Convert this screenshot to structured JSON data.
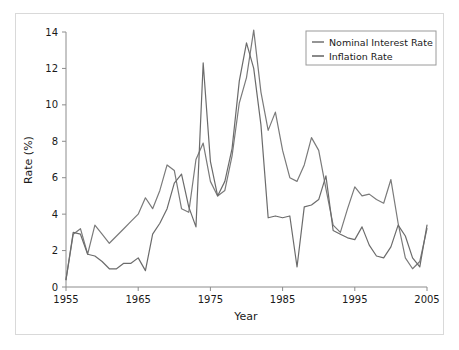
{
  "figure": {
    "background_color": "#ffffff",
    "frame_color": "#d9d9d9",
    "axis_color": "#8c8c8c"
  },
  "axes": {
    "y_title": "Rate (%)",
    "x_title": "Year",
    "y_ticks": [
      "0",
      "2",
      "4",
      "6",
      "8",
      "10",
      "12",
      "14"
    ],
    "x_ticks": [
      "1955",
      "1965",
      "1975",
      "1985",
      "1995",
      "2005"
    ]
  },
  "legend": {
    "position": "top-right",
    "entries": [
      {
        "label": "Nominal Interest Rate",
        "color": "#7a7a7a"
      },
      {
        "label": "Inflation Rate",
        "color": "#6b6b6b"
      }
    ]
  },
  "chart_data": {
    "type": "line",
    "title": "",
    "subtitle": "",
    "xlabel": "Year",
    "ylabel": "Rate (%)",
    "xlim": [
      1955,
      2005
    ],
    "ylim": [
      0,
      14
    ],
    "y_ticks": [
      0,
      2,
      4,
      6,
      8,
      10,
      12,
      14
    ],
    "x_ticks": [
      1955,
      1965,
      1975,
      1985,
      1995,
      2005
    ],
    "grid": false,
    "legend_position": "top-right",
    "x": [
      1955,
      1956,
      1957,
      1958,
      1959,
      1960,
      1961,
      1962,
      1963,
      1964,
      1965,
      1966,
      1967,
      1968,
      1969,
      1970,
      1971,
      1972,
      1973,
      1974,
      1975,
      1976,
      1977,
      1978,
      1979,
      1980,
      1981,
      1982,
      1983,
      1984,
      1985,
      1986,
      1987,
      1988,
      1989,
      1990,
      1991,
      1992,
      1993,
      1994,
      1995,
      1996,
      1997,
      1998,
      1999,
      2000,
      2001,
      2002,
      2003,
      2004,
      2005
    ],
    "series": [
      {
        "name": "Nominal Interest Rate",
        "color": "#7a7a7a",
        "values": [
          0.4,
          2.9,
          3.2,
          1.8,
          3.4,
          2.9,
          2.4,
          2.8,
          3.2,
          3.6,
          4.0,
          4.9,
          4.3,
          5.3,
          6.7,
          6.4,
          4.3,
          4.1,
          7.0,
          7.9,
          5.8,
          5.0,
          5.3,
          7.2,
          10.1,
          11.5,
          14.1,
          10.7,
          8.6,
          9.6,
          7.5,
          6.0,
          5.8,
          6.7,
          8.2,
          7.5,
          5.4,
          3.4,
          3.0,
          4.3,
          5.5,
          5.0,
          5.1,
          4.8,
          4.6,
          5.9,
          3.5,
          1.6,
          1.0,
          1.4,
          3.2
        ]
      },
      {
        "name": "Inflation Rate",
        "color": "#6b6b6b",
        "values": [
          0.4,
          3.0,
          2.9,
          1.8,
          1.7,
          1.4,
          1.0,
          1.0,
          1.3,
          1.3,
          1.6,
          0.9,
          2.9,
          3.5,
          4.3,
          5.7,
          6.2,
          4.4,
          3.3,
          12.3,
          6.9,
          5.0,
          5.8,
          7.6,
          11.3,
          13.4,
          12.0,
          8.9,
          3.8,
          3.9,
          3.8,
          3.9,
          1.1,
          4.4,
          4.5,
          4.8,
          6.1,
          3.1,
          2.9,
          2.7,
          2.6,
          3.3,
          2.3,
          1.7,
          1.6,
          2.2,
          3.4,
          2.8,
          1.6,
          1.1,
          3.4
        ]
      }
    ]
  }
}
